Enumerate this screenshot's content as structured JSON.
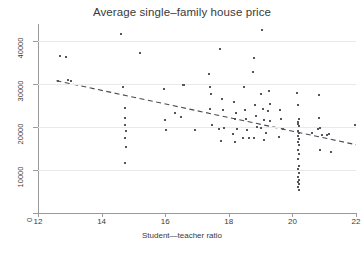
{
  "chart_data": {
    "type": "scatter",
    "title": "Average single–family house price",
    "xlabel": "Student—teacher ratio",
    "ylabel": "",
    "xlim": [
      12,
      22
    ],
    "ylim": [
      0,
      44000
    ],
    "grid": true,
    "legend": null,
    "xticks": [
      12,
      14,
      16,
      18,
      20,
      22
    ],
    "xtick_labels": [
      "12",
      "14",
      "16",
      "18",
      "20",
      "22"
    ],
    "yticks": [
      0,
      10000,
      20000,
      30000,
      40000
    ],
    "ytick_labels": [
      "0",
      "10000",
      "20000",
      "30000",
      "40000"
    ],
    "marker": {
      "shape": "square",
      "size_px": 2,
      "color": "#55555c"
    },
    "points": [
      [
        12.62,
        30800
      ],
      [
        12.7,
        36500
      ],
      [
        12.95,
        30900
      ],
      [
        13.05,
        30750
      ],
      [
        12.88,
        36400
      ],
      [
        14.62,
        41800
      ],
      [
        14.68,
        29300
      ],
      [
        14.72,
        24400
      ],
      [
        14.74,
        22100
      ],
      [
        14.74,
        20500
      ],
      [
        14.76,
        19100
      ],
      [
        14.74,
        17400
      ],
      [
        14.76,
        15400
      ],
      [
        14.72,
        11700
      ],
      [
        15.22,
        37200
      ],
      [
        15.95,
        28800
      ],
      [
        15.98,
        21600
      ],
      [
        16.02,
        19400
      ],
      [
        16.3,
        23200
      ],
      [
        16.48,
        22300
      ],
      [
        16.55,
        29800
      ],
      [
        16.58,
        29700
      ],
      [
        16.95,
        19300
      ],
      [
        17.38,
        32400
      ],
      [
        17.42,
        29400
      ],
      [
        17.45,
        27700
      ],
      [
        17.4,
        24200
      ],
      [
        17.48,
        20500
      ],
      [
        17.72,
        38100
      ],
      [
        17.78,
        26600
      ],
      [
        17.82,
        24000
      ],
      [
        17.7,
        19600
      ],
      [
        17.75,
        16700
      ],
      [
        17.85,
        19900
      ],
      [
        18.15,
        25800
      ],
      [
        18.22,
        23400
      ],
      [
        18.18,
        21900
      ],
      [
        18.25,
        19500
      ],
      [
        18.2,
        16600
      ],
      [
        18.12,
        18300
      ],
      [
        18.48,
        29300
      ],
      [
        18.52,
        23900
      ],
      [
        18.55,
        21800
      ],
      [
        18.58,
        19300
      ],
      [
        18.45,
        17500
      ],
      [
        18.62,
        17400
      ],
      [
        18.75,
        32800
      ],
      [
        18.78,
        36200
      ],
      [
        18.82,
        25200
      ],
      [
        18.85,
        22700
      ],
      [
        18.88,
        20100
      ],
      [
        18.8,
        17400
      ],
      [
        19.05,
        42700
      ],
      [
        19.02,
        27600
      ],
      [
        19.08,
        24300
      ],
      [
        19.12,
        21700
      ],
      [
        19.0,
        19800
      ],
      [
        19.1,
        16900
      ],
      [
        19.25,
        28400
      ],
      [
        19.28,
        25300
      ],
      [
        19.22,
        23800
      ],
      [
        19.3,
        21500
      ],
      [
        19.18,
        18600
      ],
      [
        19.62,
        24100
      ],
      [
        19.65,
        22000
      ],
      [
        19.7,
        19600
      ],
      [
        19.58,
        17700
      ],
      [
        20.15,
        28000
      ],
      [
        20.18,
        25100
      ],
      [
        20.2,
        21900
      ],
      [
        20.17,
        21200
      ],
      [
        20.19,
        20800
      ],
      [
        20.21,
        20300
      ],
      [
        20.18,
        19200
      ],
      [
        20.2,
        18600
      ],
      [
        20.16,
        17900
      ],
      [
        20.22,
        17200
      ],
      [
        20.18,
        16500
      ],
      [
        20.2,
        15900
      ],
      [
        20.17,
        14600
      ],
      [
        20.21,
        13800
      ],
      [
        20.19,
        12500
      ],
      [
        20.2,
        11000
      ],
      [
        20.18,
        10300
      ],
      [
        20.21,
        9400
      ],
      [
        20.17,
        8500
      ],
      [
        20.2,
        7800
      ],
      [
        20.19,
        7300
      ],
      [
        20.22,
        6700
      ],
      [
        20.18,
        6100
      ],
      [
        20.2,
        5300
      ],
      [
        20.6,
        18700
      ],
      [
        20.82,
        27500
      ],
      [
        20.85,
        22200
      ],
      [
        20.88,
        19900
      ],
      [
        20.8,
        19500
      ],
      [
        20.92,
        18100
      ],
      [
        20.86,
        14600
      ],
      [
        21.1,
        18200
      ],
      [
        21.15,
        18400
      ],
      [
        21.2,
        14200
      ],
      [
        21.98,
        20500
      ]
    ],
    "fit_line": {
      "style": "dashed",
      "color": "#4a4a52",
      "x_start": 12.58,
      "y_start": 30800,
      "x_end": 22.0,
      "y_end": 15900
    }
  }
}
